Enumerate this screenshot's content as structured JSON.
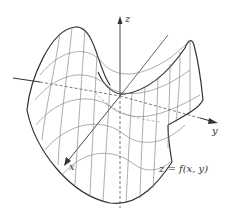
{
  "figure": {
    "surface_type": "hyperbolic paraboloid (saddle)",
    "colors": {
      "stroke": "#333333",
      "mesh": "#777777",
      "background": "#ffffff"
    }
  },
  "labels": {
    "z_axis": "z",
    "y_axis": "y",
    "x_axis": "x",
    "function": "z = f(x, y)"
  }
}
